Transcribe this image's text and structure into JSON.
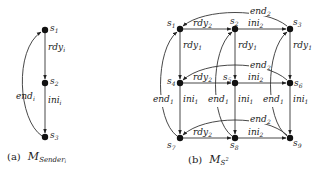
{
  "diagram_a": {
    "caption_prefix": "(a)",
    "caption_math": "M",
    "caption_sub": "Sender",
    "caption_subsub": "i",
    "nodes": [
      {
        "id": "s1",
        "name": "s",
        "sub": "1"
      },
      {
        "id": "s2",
        "name": "s",
        "sub": "2"
      },
      {
        "id": "s3",
        "name": "s",
        "sub": "3"
      }
    ],
    "edges": [
      {
        "from": "s1",
        "to": "s2",
        "label": "rdy",
        "sub": "i"
      },
      {
        "from": "s2",
        "to": "s3",
        "label": "ini",
        "sub": "i"
      },
      {
        "from": "s3",
        "to": "s1",
        "label": "end",
        "sub": "i"
      }
    ]
  },
  "diagram_b": {
    "caption_prefix": "(b)",
    "caption_math": "M",
    "caption_sub": "S",
    "caption_sup": "2",
    "nodes": [
      {
        "id": "s1",
        "name": "s",
        "sub": "1"
      },
      {
        "id": "s2",
        "name": "s",
        "sub": "2"
      },
      {
        "id": "s3",
        "name": "s",
        "sub": "3"
      },
      {
        "id": "s4",
        "name": "s",
        "sub": "4"
      },
      {
        "id": "s5",
        "name": "s",
        "sub": "5"
      },
      {
        "id": "s6",
        "name": "s",
        "sub": "6"
      },
      {
        "id": "s7",
        "name": "s",
        "sub": "7"
      },
      {
        "id": "s8",
        "name": "s",
        "sub": "8"
      },
      {
        "id": "s9",
        "name": "s",
        "sub": "9"
      }
    ],
    "edge_labels": {
      "rdy2": {
        "label": "rdy",
        "sub": "2"
      },
      "ini2": {
        "label": "ini",
        "sub": "2"
      },
      "end2": {
        "label": "end",
        "sub": "2"
      },
      "rdy1": {
        "label": "rdy",
        "sub": "1"
      },
      "ini1": {
        "label": "ini",
        "sub": "1"
      },
      "end1": {
        "label": "end",
        "sub": "1"
      }
    },
    "edges": [
      {
        "from": "s1",
        "to": "s2",
        "label": "rdy2"
      },
      {
        "from": "s2",
        "to": "s3",
        "label": "ini2"
      },
      {
        "from": "s3",
        "to": "s1",
        "label": "end2"
      },
      {
        "from": "s4",
        "to": "s5",
        "label": "rdy2"
      },
      {
        "from": "s5",
        "to": "s6",
        "label": "ini2"
      },
      {
        "from": "s6",
        "to": "s4",
        "label": "end2"
      },
      {
        "from": "s7",
        "to": "s8",
        "label": "rdy2"
      },
      {
        "from": "s8",
        "to": "s9",
        "label": "ini2"
      },
      {
        "from": "s9",
        "to": "s7",
        "label": "end2"
      },
      {
        "from": "s1",
        "to": "s4",
        "label": "rdy1"
      },
      {
        "from": "s4",
        "to": "s7",
        "label": "ini1"
      },
      {
        "from": "s7",
        "to": "s1",
        "label": "end1"
      },
      {
        "from": "s2",
        "to": "s5",
        "label": "rdy1"
      },
      {
        "from": "s5",
        "to": "s8",
        "label": "ini1"
      },
      {
        "from": "s8",
        "to": "s2",
        "label": "end1"
      },
      {
        "from": "s3",
        "to": "s6",
        "label": "rdy1"
      },
      {
        "from": "s6",
        "to": "s9",
        "label": "ini1"
      },
      {
        "from": "s9",
        "to": "s3",
        "label": "end1"
      }
    ]
  }
}
